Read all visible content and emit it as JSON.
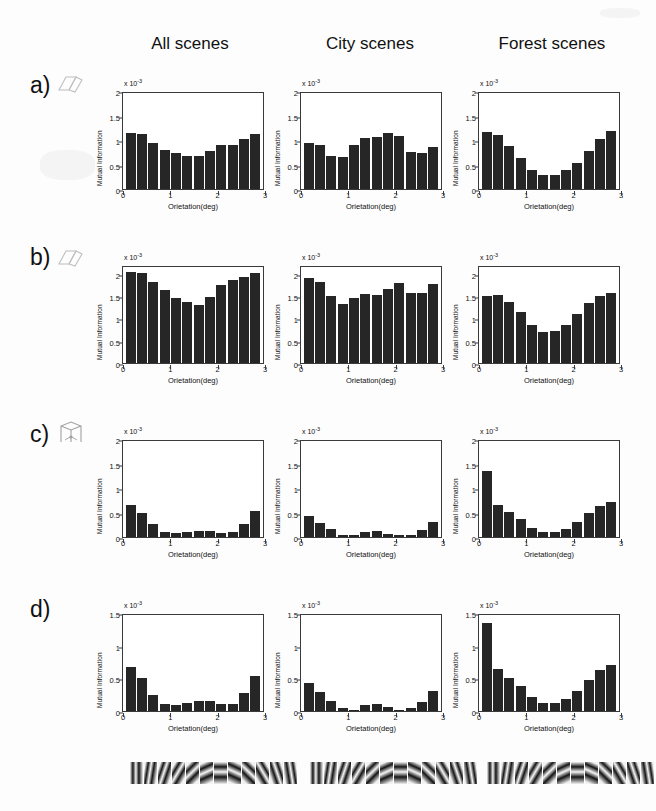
{
  "figure": {
    "column_headers": [
      "All scenes",
      "City scenes",
      "Forest scenes"
    ],
    "row_labels": [
      "a)",
      "b)",
      "c)",
      "d)"
    ],
    "row_icons": [
      "parallelogram-icon",
      "parallelogram-icon",
      "cube-icon",
      "none"
    ],
    "axis": {
      "xlabel": "Orietation(deg)",
      "ylabel": "Mutual Information",
      "multiplier": "x 10",
      "multiplier_exponent": "-3",
      "xticks": [
        "0",
        "1",
        "2",
        "3"
      ]
    },
    "gabor_strip": {
      "name": "gabor-filter-strip",
      "count": 12,
      "angles_deg": [
        0,
        15,
        30,
        45,
        60,
        75,
        90,
        105,
        120,
        135,
        150,
        165
      ]
    }
  },
  "chart_data": [
    {
      "type": "bar",
      "panel": "a-all",
      "row": "a)",
      "title": "All scenes",
      "xlabel": "Orietation(deg)",
      "ylabel": "Mutual Information",
      "multiplier": "x 10^-3",
      "ylim": [
        0,
        2
      ],
      "yticks": [
        0,
        0.5,
        1,
        1.5,
        2
      ],
      "ytick_labels": [
        "0",
        "0.5",
        "1",
        "1.5",
        "2"
      ],
      "xlim": [
        0,
        3
      ],
      "xticks": [
        0,
        1,
        2,
        3
      ],
      "x": [
        0.125,
        0.375,
        0.625,
        0.875,
        1.125,
        1.375,
        1.625,
        1.875,
        2.125,
        2.375,
        2.625,
        2.875
      ],
      "values": [
        1.15,
        1.12,
        0.93,
        0.8,
        0.73,
        0.67,
        0.67,
        0.77,
        0.89,
        0.9,
        1.02,
        1.13
      ]
    },
    {
      "type": "bar",
      "panel": "a-city",
      "row": "a)",
      "title": "City scenes",
      "xlabel": "Orietation(deg)",
      "ylabel": "Mutual Information",
      "multiplier": "x 10^-3",
      "ylim": [
        0,
        2
      ],
      "yticks": [
        0,
        0.5,
        1,
        1.5,
        2
      ],
      "ytick_labels": [
        "0",
        "0.5",
        "1",
        "1.5",
        "2"
      ],
      "xlim": [
        0,
        3
      ],
      "xticks": [
        0,
        1,
        2,
        3
      ],
      "x": [
        0.125,
        0.375,
        0.625,
        0.875,
        1.125,
        1.375,
        1.625,
        1.875,
        2.125,
        2.375,
        2.625,
        2.875
      ],
      "values": [
        0.94,
        0.9,
        0.68,
        0.65,
        0.9,
        1.05,
        1.07,
        1.14,
        1.09,
        0.75,
        0.73,
        0.86
      ]
    },
    {
      "type": "bar",
      "panel": "a-forest",
      "row": "a)",
      "title": "Forest scenes",
      "xlabel": "Orietation(deg)",
      "ylabel": "Mutual Information",
      "multiplier": "x 10^-3",
      "ylim": [
        0,
        2
      ],
      "yticks": [
        0,
        0.5,
        1,
        1.5,
        2
      ],
      "ytick_labels": [
        "0",
        "0.5",
        "1",
        "1.5",
        "2"
      ],
      "xlim": [
        0,
        3
      ],
      "xticks": [
        0,
        1,
        2,
        3
      ],
      "x": [
        0.125,
        0.375,
        0.625,
        0.875,
        1.125,
        1.375,
        1.625,
        1.875,
        2.125,
        2.375,
        2.625,
        2.875
      ],
      "values": [
        1.17,
        1.11,
        0.87,
        0.63,
        0.39,
        0.29,
        0.29,
        0.38,
        0.54,
        0.77,
        1.02,
        1.18
      ]
    },
    {
      "type": "bar",
      "panel": "b-all",
      "row": "b)",
      "title": "All scenes",
      "xlabel": "Orietation(deg)",
      "ylabel": "Mutual Information",
      "multiplier": "x 10^-3",
      "ylim": [
        0,
        2.2
      ],
      "yticks": [
        0,
        0.5,
        1,
        1.5,
        2
      ],
      "ytick_labels": [
        "0",
        "0.5",
        "1",
        "1.5",
        "2"
      ],
      "xlim": [
        0,
        3
      ],
      "xticks": [
        0,
        1,
        2,
        3
      ],
      "x": [
        0.125,
        0.375,
        0.625,
        0.875,
        1.125,
        1.375,
        1.625,
        1.875,
        2.125,
        2.375,
        2.625,
        2.875
      ],
      "values": [
        2.05,
        2.02,
        1.82,
        1.65,
        1.47,
        1.36,
        1.3,
        1.48,
        1.76,
        1.86,
        1.92,
        2.02
      ]
    },
    {
      "type": "bar",
      "panel": "b-city",
      "row": "b)",
      "title": "City scenes",
      "xlabel": "Orietation(deg)",
      "ylabel": "Mutual Information",
      "multiplier": "x 10^-3",
      "ylim": [
        0,
        2.2
      ],
      "yticks": [
        0,
        0.5,
        1,
        1.5,
        2
      ],
      "ytick_labels": [
        "0",
        "0.5",
        "1",
        "1.5",
        "2"
      ],
      "xlim": [
        0,
        3
      ],
      "xticks": [
        0,
        1,
        2,
        3
      ],
      "x": [
        0.125,
        0.375,
        0.625,
        0.875,
        1.125,
        1.375,
        1.625,
        1.875,
        2.125,
        2.375,
        2.625,
        2.875
      ],
      "values": [
        1.9,
        1.82,
        1.5,
        1.32,
        1.45,
        1.55,
        1.53,
        1.66,
        1.8,
        1.57,
        1.58,
        1.77
      ]
    },
    {
      "type": "bar",
      "panel": "b-forest",
      "row": "b)",
      "title": "Forest scenes",
      "xlabel": "Orietation(deg)",
      "ylabel": "Mutual Information",
      "multiplier": "x 10^-3",
      "ylim": [
        0,
        2.2
      ],
      "yticks": [
        0,
        0.5,
        1,
        1.5,
        2
      ],
      "ytick_labels": [
        "0",
        "0.5",
        "1",
        "1.5",
        "2"
      ],
      "xlim": [
        0,
        3
      ],
      "xticks": [
        0,
        1,
        2,
        3
      ],
      "x": [
        0.125,
        0.375,
        0.625,
        0.875,
        1.125,
        1.375,
        1.625,
        1.875,
        2.125,
        2.375,
        2.625,
        2.875
      ],
      "values": [
        1.5,
        1.52,
        1.38,
        1.15,
        0.86,
        0.7,
        0.71,
        0.86,
        1.09,
        1.34,
        1.51,
        1.57
      ]
    },
    {
      "type": "bar",
      "panel": "c-all",
      "row": "c)",
      "title": "All scenes",
      "xlabel": "Orietation(deg)",
      "ylabel": "Mutual Information",
      "multiplier": "x 10^-3",
      "ylim": [
        0,
        2
      ],
      "yticks": [
        0,
        0.5,
        1,
        1.5,
        2
      ],
      "ytick_labels": [
        "0",
        "0.5",
        "1",
        "1.5",
        "2"
      ],
      "xlim": [
        0,
        3
      ],
      "xticks": [
        0,
        1,
        2,
        3
      ],
      "x": [
        0.125,
        0.375,
        0.625,
        0.875,
        1.125,
        1.375,
        1.625,
        1.875,
        2.125,
        2.375,
        2.625,
        2.875
      ],
      "values": [
        0.66,
        0.5,
        0.26,
        0.1,
        0.09,
        0.11,
        0.13,
        0.12,
        0.08,
        0.1,
        0.26,
        0.53
      ]
    },
    {
      "type": "bar",
      "panel": "c-city",
      "row": "c)",
      "title": "City scenes",
      "xlabel": "Orietation(deg)",
      "ylabel": "Mutual Information",
      "multiplier": "x 10^-3",
      "ylim": [
        0,
        2
      ],
      "yticks": [
        0,
        0.5,
        1,
        1.5,
        2
      ],
      "ytick_labels": [
        "0",
        "0.5",
        "1",
        "1.5",
        "2"
      ],
      "xlim": [
        0,
        3
      ],
      "xticks": [
        0,
        1,
        2,
        3
      ],
      "x": [
        0.125,
        0.375,
        0.625,
        0.875,
        1.125,
        1.375,
        1.625,
        1.875,
        2.125,
        2.375,
        2.625,
        2.875
      ],
      "values": [
        0.43,
        0.28,
        0.16,
        0.04,
        0.04,
        0.1,
        0.12,
        0.07,
        0.04,
        0.05,
        0.14,
        0.3
      ]
    },
    {
      "type": "bar",
      "panel": "c-forest",
      "row": "c)",
      "title": "Forest scenes",
      "xlabel": "Orietation(deg)",
      "ylabel": "Mutual Information",
      "multiplier": "x 10^-3",
      "ylim": [
        0,
        2
      ],
      "yticks": [
        0,
        0.5,
        1,
        1.5,
        2
      ],
      "ytick_labels": [
        "0",
        "0.5",
        "1",
        "1.5",
        "2"
      ],
      "xlim": [
        0,
        3
      ],
      "xticks": [
        0,
        1,
        2,
        3
      ],
      "x": [
        0.125,
        0.375,
        0.625,
        0.875,
        1.125,
        1.375,
        1.625,
        1.875,
        2.125,
        2.375,
        2.625,
        2.875
      ],
      "values": [
        1.35,
        0.65,
        0.51,
        0.36,
        0.19,
        0.11,
        0.11,
        0.17,
        0.3,
        0.48,
        0.63,
        0.72
      ]
    },
    {
      "type": "bar",
      "panel": "d-all",
      "row": "d)",
      "title": "All scenes",
      "xlabel": "Orietation(deg)",
      "ylabel": "Mutual Information",
      "multiplier": "x 10^-3",
      "ylim": [
        0,
        1.5
      ],
      "yticks": [
        0,
        0.5,
        1,
        1.5
      ],
      "ytick_labels": [
        "0",
        "0.5",
        "1",
        "1.5"
      ],
      "xlim": [
        0,
        3
      ],
      "xticks": [
        0,
        1,
        2,
        3
      ],
      "x": [
        0.125,
        0.375,
        0.625,
        0.875,
        1.125,
        1.375,
        1.625,
        1.875,
        2.125,
        2.375,
        2.625,
        2.875
      ],
      "values": [
        0.67,
        0.5,
        0.25,
        0.11,
        0.09,
        0.12,
        0.16,
        0.15,
        0.1,
        0.11,
        0.27,
        0.54
      ]
    },
    {
      "type": "bar",
      "panel": "d-city",
      "row": "d)",
      "title": "City scenes",
      "xlabel": "Orietation(deg)",
      "ylabel": "Mutual Information",
      "multiplier": "x 10^-3",
      "ylim": [
        0,
        1.5
      ],
      "yticks": [
        0,
        0.5,
        1,
        1.5
      ],
      "ytick_labels": [
        "0",
        "0.5",
        "1",
        "1.5"
      ],
      "xlim": [
        0,
        3
      ],
      "xticks": [
        0,
        1,
        2,
        3
      ],
      "x": [
        0.125,
        0.375,
        0.625,
        0.875,
        1.125,
        1.375,
        1.625,
        1.875,
        2.125,
        2.375,
        2.625,
        2.875
      ],
      "values": [
        0.43,
        0.29,
        0.16,
        0.05,
        0.02,
        0.09,
        0.11,
        0.06,
        0.02,
        0.05,
        0.14,
        0.3
      ]
    },
    {
      "type": "bar",
      "panel": "d-forest",
      "row": "d)",
      "title": "Forest scenes",
      "xlabel": "Orietation(deg)",
      "ylabel": "Mutual Information",
      "multiplier": "x 10^-3",
      "ylim": [
        0,
        1.5
      ],
      "yticks": [
        0,
        0.5,
        1,
        1.5
      ],
      "ytick_labels": [
        "0",
        "0.5",
        "1",
        "1.5"
      ],
      "xlim": [
        0,
        3
      ],
      "xticks": [
        0,
        1,
        2,
        3
      ],
      "x": [
        0.125,
        0.375,
        0.625,
        0.875,
        1.125,
        1.375,
        1.625,
        1.875,
        2.125,
        2.375,
        2.625,
        2.875
      ],
      "values": [
        1.35,
        0.64,
        0.51,
        0.38,
        0.22,
        0.13,
        0.13,
        0.19,
        0.31,
        0.48,
        0.63,
        0.7
      ]
    }
  ]
}
